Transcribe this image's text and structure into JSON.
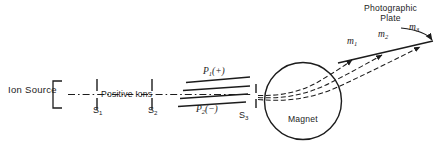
{
  "figure": {
    "kind": "mass-spectrometer-schematic",
    "background_color": "#ffffff",
    "ink_color": "#1c1c1c",
    "width": 446,
    "height": 156
  },
  "labels": {
    "ion_source": "Ion Source",
    "positive_ions": "Positive Ions",
    "magnet": "Magnet",
    "photographic_plate_line1": "Photographic",
    "photographic_plate_line2": "Plate"
  },
  "slits": [
    {
      "id": "s1",
      "base": "S",
      "sub": "1"
    },
    {
      "id": "s2",
      "base": "S",
      "sub": "2"
    },
    {
      "id": "s3",
      "base": "S",
      "sub": "3"
    }
  ],
  "plates": [
    {
      "id": "p1",
      "base": "P",
      "sub": "1",
      "charge": "(+)"
    },
    {
      "id": "p2",
      "base": "P",
      "sub": "2",
      "charge": "(−)"
    }
  ],
  "masses": [
    {
      "id": "m1",
      "base": "m",
      "sub": "1"
    },
    {
      "id": "m2",
      "base": "m",
      "sub": "2"
    },
    {
      "id": "m3",
      "base": "m",
      "sub": "3"
    }
  ]
}
